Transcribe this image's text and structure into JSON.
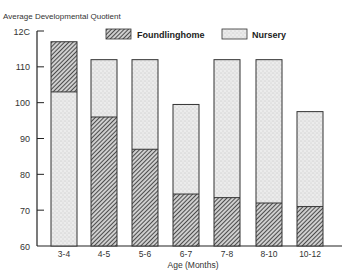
{
  "chart_data": {
    "type": "bar",
    "stacked_overlay": true,
    "title": "",
    "ylabel": "Average Developmental Quotient",
    "xlabel": "Age (Months)",
    "ylim": [
      60,
      120
    ],
    "yticks": [
      60,
      70,
      80,
      90,
      100,
      110,
      120
    ],
    "ytick_labels": [
      "60",
      "70",
      "80",
      "90",
      "100",
      "110",
      "12C"
    ],
    "categories": [
      "3-4",
      "4-5",
      "5-6",
      "6-7",
      "7-8",
      "8-10",
      "10-12"
    ],
    "series": [
      {
        "name": "Foundlinghome",
        "pattern": "diagonal-hatch",
        "values": [
          117,
          96,
          87,
          74.5,
          73.5,
          72,
          71
        ]
      },
      {
        "name": "Nursery",
        "pattern": "stipple",
        "values": [
          103,
          112,
          112,
          99.5,
          112,
          112,
          97.5
        ]
      }
    ],
    "legend": {
      "position": "top",
      "entries": [
        "Foundlinghome",
        "Nursery"
      ]
    },
    "grid": false
  },
  "labels": {
    "ylabel": "Average Developmental Quotient",
    "xlabel": "Age (Months)",
    "legend_foundling": "Foundlinghome",
    "legend_nursery": "Nursery",
    "yticks": [
      "12C",
      "110",
      "100",
      "90",
      "80",
      "70",
      "60"
    ],
    "xticks": [
      "3-4",
      "4-5",
      "5-6",
      "6-7",
      "7-8",
      "8-10",
      "10-12"
    ]
  }
}
